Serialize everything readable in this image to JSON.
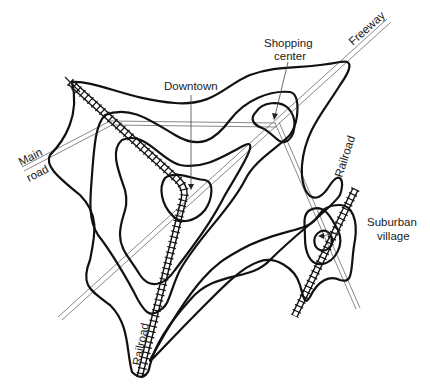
{
  "diagram": {
    "type": "urban land value / density contour map",
    "colors": {
      "contour": "#111111",
      "road": "#888888",
      "railroad": "#111111",
      "text": "#222222",
      "background": "#ffffff"
    },
    "labels": {
      "downtown": "Downtown",
      "shopping_center_line1": "Shopping",
      "shopping_center_line2": "center",
      "freeway": "Freeway",
      "main_road_line1": "Main",
      "main_road_line2": "road",
      "railroad_right": "Railroad",
      "railroad_left": "Railroad",
      "suburban_village_line1": "Suburban",
      "suburban_village_line2": "village"
    },
    "features": {
      "peaks": [
        "Downtown",
        "Shopping center",
        "Suburban village"
      ],
      "transport": [
        "Freeway",
        "Main road",
        "Railroad",
        "Railroad"
      ],
      "contour_count_downtown": 4,
      "contour_count_suburban": 3
    }
  }
}
